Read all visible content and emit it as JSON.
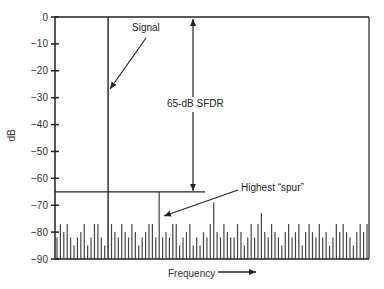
{
  "chart_data": {
    "type": "bar",
    "title": "",
    "xlabel": "Frequency",
    "ylabel": "dB",
    "ylim": [
      -90,
      0
    ],
    "yticks": [
      0,
      -10,
      -20,
      -30,
      -40,
      -50,
      -60,
      -70,
      -80,
      -90
    ],
    "ytick_labels": [
      "0",
      "−10",
      "−20",
      "−30",
      "−40",
      "−50",
      "−60",
      "−70",
      "−80",
      "−90"
    ],
    "grid": false,
    "legend": null,
    "signal": {
      "label": "Signal",
      "x_index": 14,
      "value": 0
    },
    "highest_spur": {
      "label": "Highest “spur”",
      "x_index": 30,
      "value": -65
    },
    "sfdr": {
      "label": "65-dB SFDR",
      "top": 0,
      "bottom": -65,
      "value_db": 65
    },
    "reference_line": {
      "value": -65
    },
    "noise_floor_values": [
      -82,
      -77,
      -80,
      -77,
      -82,
      -85,
      -82,
      -80,
      -77,
      -85,
      -82,
      -77,
      -77,
      -82,
      -85,
      0,
      -77,
      -80,
      -82,
      -77,
      -80,
      -82,
      -77,
      -80,
      -85,
      -82,
      -80,
      -77,
      -77,
      -82,
      -65,
      -82,
      -80,
      -82,
      -77,
      -77,
      -85,
      -82,
      -80,
      -77,
      -85,
      -82,
      -85,
      -80,
      -82,
      -77,
      -69,
      -80,
      -82,
      -77,
      -80,
      -82,
      -82,
      -77,
      -80,
      -85,
      -82,
      -77,
      -82,
      -77,
      -73,
      -80,
      -82,
      -77,
      -80,
      -82,
      -85,
      -80,
      -77,
      -82,
      -80,
      -77,
      -85,
      -80,
      -77,
      -80,
      -82,
      -77,
      -82,
      -80,
      -85,
      -82,
      -77,
      -80,
      -77,
      -80,
      -82,
      -85,
      -80,
      -77,
      -80,
      -77
    ]
  },
  "labels": {
    "signal": "Signal",
    "sfdr": "65-dB SFDR",
    "highest_spur": "Highest “spur”",
    "xlabel": "Frequency",
    "ylabel": "dB"
  }
}
